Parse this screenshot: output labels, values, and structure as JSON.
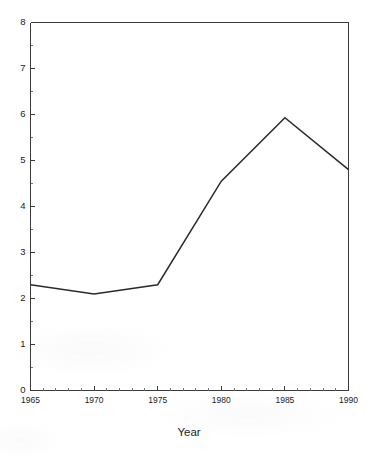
{
  "chart_data": {
    "type": "line",
    "title": "",
    "subtitle": "",
    "xlabel": "Year",
    "ylabel": "",
    "x": [
      1965,
      1970,
      1975,
      1980,
      1985,
      1990
    ],
    "series": [
      {
        "name": "",
        "values": [
          2.3,
          2.1,
          2.3,
          4.55,
          5.93,
          4.8
        ]
      }
    ],
    "xlim": [
      1965,
      1990
    ],
    "ylim": [
      0,
      8
    ],
    "x_tick_labels": [
      "1965",
      "1970",
      "1975",
      "1980",
      "1985",
      "1990"
    ],
    "x_tick_values": [
      1965,
      1970,
      1975,
      1980,
      1985,
      1990
    ],
    "x_minor_step": 1,
    "y_tick_labels": [
      "0",
      "1",
      "2",
      "3",
      "4",
      "5",
      "6",
      "7",
      "8"
    ],
    "y_tick_values": [
      0,
      1,
      2,
      3,
      4,
      5,
      6,
      7,
      8
    ],
    "y_minor_step": 0.5,
    "grid": false,
    "legend": false,
    "legend_position": "none",
    "line_color": "#2a2a2a",
    "axis_color": "#3c3c3c",
    "background_color": "#ffffff"
  },
  "axes": {
    "x_title": "Year",
    "y_title": ""
  },
  "y_ticks": [
    {
      "label": "8",
      "value": 8
    },
    {
      "label": "7",
      "value": 7
    },
    {
      "label": "6",
      "value": 6
    },
    {
      "label": "5",
      "value": 5
    },
    {
      "label": "4",
      "value": 4
    },
    {
      "label": "3",
      "value": 3
    },
    {
      "label": "2",
      "value": 2
    },
    {
      "label": "1",
      "value": 1
    },
    {
      "label": "0",
      "value": 0
    }
  ],
  "x_ticks": [
    {
      "label": "1965",
      "value": 1965
    },
    {
      "label": "1970",
      "value": 1970
    },
    {
      "label": "1975",
      "value": 1975
    },
    {
      "label": "1980",
      "value": 1980
    },
    {
      "label": "1985",
      "value": 1985
    },
    {
      "label": "1990",
      "value": 1990
    }
  ]
}
